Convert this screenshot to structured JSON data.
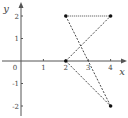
{
  "chart_data": {
    "type": "scatter",
    "title": "",
    "xlabel": "x",
    "ylabel": "y",
    "xlim": [
      -0.3,
      4.6
    ],
    "ylim": [
      -2.5,
      2.6
    ],
    "x_ticks": [
      1,
      2,
      3,
      4
    ],
    "x_tick_labels": [
      "1",
      "2",
      "3",
      "4"
    ],
    "y_ticks": [
      -2,
      -1,
      1,
      2
    ],
    "y_tick_labels": [
      "-2",
      "-1",
      "1",
      "2"
    ],
    "origin_label": "0",
    "points": [
      {
        "x": 2,
        "y": 2
      },
      {
        "x": 4,
        "y": 2
      },
      {
        "x": 2,
        "y": 0
      },
      {
        "x": 4,
        "y": -2
      }
    ],
    "segments": [
      {
        "from": [
          2,
          2
        ],
        "to": [
          4,
          2
        ],
        "style": "dotted"
      },
      {
        "from": [
          2,
          2
        ],
        "to": [
          4,
          -2
        ],
        "style": "dashed"
      },
      {
        "from": [
          2,
          0
        ],
        "to": [
          4,
          2
        ],
        "style": "dashed"
      },
      {
        "from": [
          2,
          0
        ],
        "to": [
          4,
          -2
        ],
        "style": "dashed"
      }
    ],
    "grid": false,
    "colors": {
      "axis": "#555555",
      "point": "#111111",
      "line": "#333333"
    }
  }
}
